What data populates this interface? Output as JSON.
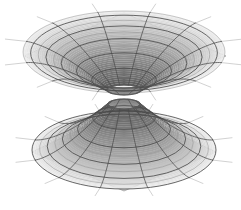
{
  "figure": {
    "domain_kind": "scientific-illustration",
    "background_color": "#ffffff",
    "caption": ""
  },
  "palette": {
    "background": "#ffffff",
    "sheet_light": "#f2f2f2",
    "sheet_mid": "#dcdcdc",
    "sheet_dark": "#b4b4b4",
    "sheet_deep": "#8c8c8c",
    "throat_shadow": "#5a5a5a",
    "grid_line": "#4a4a4a",
    "grid_line_soft": "#8a8a8a",
    "edge_line": "#9a9a9a"
  },
  "sheets": [
    {
      "id": "upper-sheet",
      "label": "Upper curved sheet",
      "orientation": "funnel-down",
      "plane_color": "#efefef",
      "funnel_color": "#c6c6c6",
      "center_x": 124,
      "center_y": 52,
      "plane_half_width": 101,
      "plane_half_height": 41,
      "skew": 0.62,
      "throat_radius_x": 17,
      "throat_radius_y": 5,
      "throat_depth": 38,
      "rings": 11,
      "spokes": 24,
      "visible_spokes": 12,
      "corner_top_x": 124,
      "corner_top_y": 13,
      "corner_left_x": 24,
      "corner_left_y": 56,
      "corner_right_x": 226,
      "corner_right_y": 56,
      "corner_bottom_x": 124,
      "corner_bottom_y": 93
    },
    {
      "id": "lower-sheet",
      "label": "Lower curved sheet",
      "orientation": "funnel-up",
      "plane_color": "#d2d2d2",
      "funnel_color": "#a8a8a8",
      "center_x": 124,
      "center_y": 150,
      "plane_half_width": 92,
      "plane_half_height": 39,
      "skew": 0.6,
      "throat_radius_x": 16,
      "throat_radius_y": 5,
      "throat_depth": 46,
      "rings": 10,
      "spokes": 24,
      "visible_spokes": 12,
      "corner_top_x": 124,
      "corner_top_y": 108,
      "corner_left_x": 32,
      "corner_left_y": 152,
      "corner_right_x": 216,
      "corner_right_y": 152,
      "corner_bottom_x": 124,
      "corner_bottom_y": 191
    }
  ],
  "throat": {
    "label": "wormhole throat",
    "gap_top_y": 87,
    "gap_bottom_y": 95,
    "half_width": 17
  },
  "grid": {
    "ring_label": "circles of constant radius",
    "spoke_label": "radial geodesic lines",
    "line_width_major": 0.9,
    "line_width_minor": 0.5
  }
}
